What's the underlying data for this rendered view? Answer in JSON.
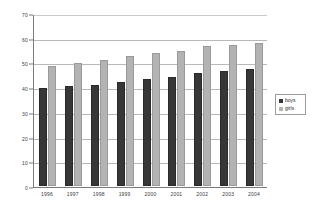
{
  "chart_data": {
    "type": "bar",
    "title": "",
    "subtitle": "",
    "xlabel": "",
    "ylabel": "",
    "categories": [
      "1996",
      "1997",
      "1998",
      "1999",
      "2000",
      "2001",
      "2002",
      "2003",
      "2004"
    ],
    "series": [
      {
        "name": "boys",
        "color": "#373737",
        "values": [
          39.8,
          40.3,
          41.0,
          42.1,
          43.4,
          44.2,
          45.6,
          46.7,
          47.5
        ]
      },
      {
        "name": "girls",
        "color": "#b3b3b3",
        "values": [
          48.6,
          49.7,
          51.0,
          52.7,
          53.9,
          54.7,
          56.5,
          57.1,
          57.9
        ]
      }
    ],
    "ylim": [
      0,
      70
    ],
    "ytick_step": 10,
    "yticks": [
      "0",
      "10",
      "20",
      "30",
      "40",
      "50",
      "60",
      "70"
    ],
    "grid": true,
    "legend_position": "right",
    "legend_entries": [
      "boys",
      "girls"
    ]
  }
}
